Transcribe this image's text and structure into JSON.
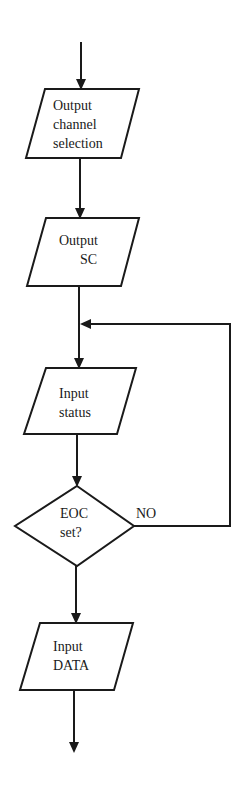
{
  "diagram": {
    "type": "flowchart",
    "nodes": [
      {
        "id": "n1",
        "shape": "parallelogram",
        "lines": [
          "Output",
          "channel",
          "selection"
        ]
      },
      {
        "id": "n2",
        "shape": "parallelogram",
        "lines": [
          "Output",
          "SC"
        ]
      },
      {
        "id": "n3",
        "shape": "parallelogram",
        "lines": [
          "Input",
          "status"
        ]
      },
      {
        "id": "n4",
        "shape": "diamond",
        "lines": [
          "EOC",
          "set?"
        ]
      },
      {
        "id": "n5",
        "shape": "parallelogram",
        "lines": [
          "Input",
          "DATA"
        ]
      }
    ],
    "edges": [
      {
        "from": "start",
        "to": "n1",
        "label": ""
      },
      {
        "from": "n1",
        "to": "n2",
        "label": ""
      },
      {
        "from": "n2",
        "to": "n3",
        "label": ""
      },
      {
        "from": "n3",
        "to": "n4",
        "label": ""
      },
      {
        "from": "n4",
        "to": "n3",
        "label": "NO"
      },
      {
        "from": "n4",
        "to": "n5",
        "label": ""
      },
      {
        "from": "n5",
        "to": "end",
        "label": ""
      }
    ],
    "no_label": "NO",
    "colors": {
      "stroke": "#1a1a1a",
      "background": "#ffffff"
    }
  }
}
